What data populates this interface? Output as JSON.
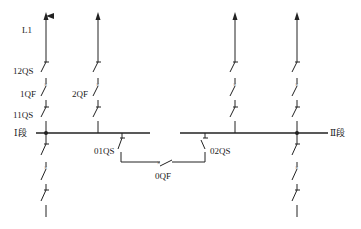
{
  "diagram": {
    "type": "single-line electrical diagram",
    "labels": {
      "line": "L1",
      "switch_12qs": "12QS",
      "breaker_1qf": "1QF",
      "switch_11qs": "11QS",
      "breaker_2qf": "2QF",
      "bus_section_1": "Ⅰ段",
      "bus_section_2": "Ⅱ段",
      "switch_01qs": "01QS",
      "switch_02qs": "02QS",
      "breaker_0qf": "0QF"
    },
    "colors": {
      "line": "#222222",
      "background": "#ffffff"
    }
  }
}
